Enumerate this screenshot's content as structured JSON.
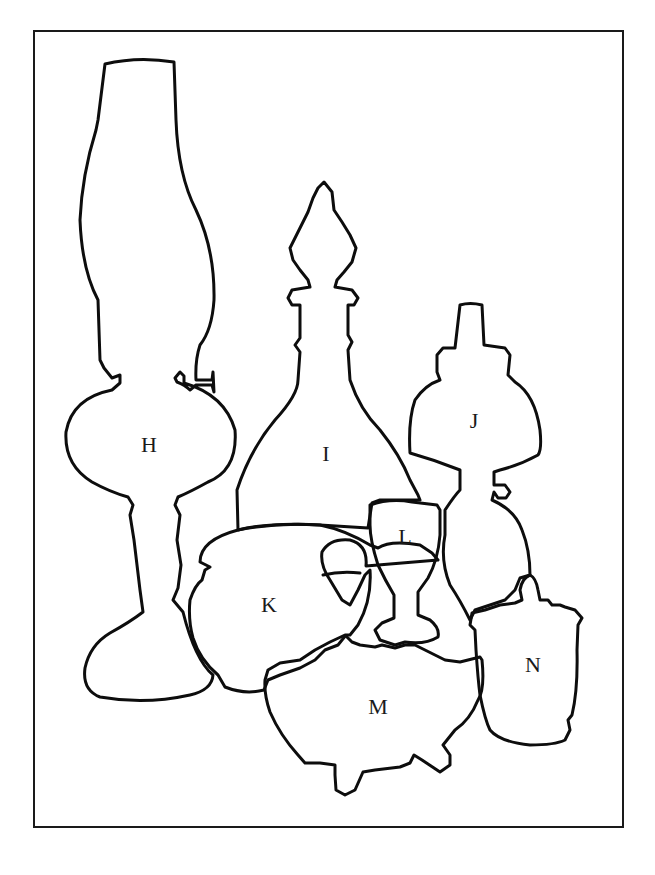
{
  "figure": {
    "type": "still-life outline drawing",
    "frame_color": "#1a1a1a",
    "stroke_color": "#0d0d0d",
    "background": "#ffffff"
  },
  "objects": [
    {
      "id": "H",
      "label": "H",
      "name": "oil lamp with chimney"
    },
    {
      "id": "I",
      "label": "I",
      "name": "decanter with stopper"
    },
    {
      "id": "J",
      "label": "J",
      "name": "small lamp with shade"
    },
    {
      "id": "K",
      "label": "K",
      "name": "pitcher"
    },
    {
      "id": "L",
      "label": "L",
      "name": "goblet"
    },
    {
      "id": "M",
      "label": "M",
      "name": "footed bowl"
    },
    {
      "id": "N",
      "label": "N",
      "name": "lidded jar"
    }
  ]
}
